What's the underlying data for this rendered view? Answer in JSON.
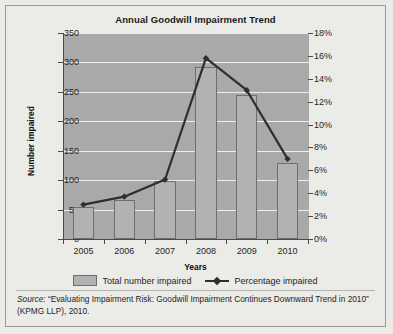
{
  "chart_data": {
    "type": "bar",
    "title": "Annual Goodwill Impairment Trend",
    "xlabel": "Years",
    "ylabel": "Number impaired",
    "ylabel_right": "Percentage of total population",
    "categories": [
      "2005",
      "2006",
      "2007",
      "2008",
      "2009",
      "2010"
    ],
    "grid": true,
    "legend_position": "bottom",
    "ylim": [
      0,
      350
    ],
    "ylim_right": [
      0,
      18
    ],
    "yticks": [
      "0",
      "50",
      "100",
      "150",
      "200",
      "250",
      "300",
      "350"
    ],
    "yticks_right": [
      "0%",
      "2%",
      "4%",
      "6%",
      "8%",
      "10%",
      "12%",
      "14%",
      "16%",
      "18%"
    ],
    "series": [
      {
        "name": "Total number impaired",
        "type": "bar",
        "axis": "left",
        "color": "#b2b2b2",
        "values": [
          55,
          67,
          98,
          292,
          245,
          129
        ]
      },
      {
        "name": "Percentage impaired",
        "type": "line",
        "axis": "right",
        "color": "#2e2e2e",
        "values": [
          3.0,
          3.7,
          5.2,
          15.8,
          13.0,
          7.0
        ]
      }
    ]
  },
  "figure": {
    "title": "Annual Goodwill Impairment Trend",
    "legend": [
      {
        "label": "Total number impaired",
        "marker": "bar-swatch"
      },
      {
        "label": "Percentage impaired",
        "marker": "line-diamond"
      }
    ],
    "source": {
      "label": "Source:",
      "text": " “Evaluating Impairment Risk: Goodwill Impairment Continues Downward Trend in 2010” (KPMG LLP), 2010."
    }
  }
}
